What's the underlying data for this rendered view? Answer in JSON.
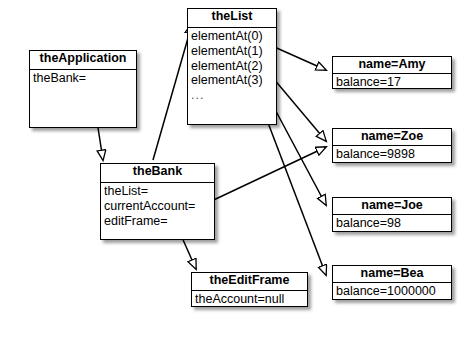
{
  "diagram": {
    "type": "uml-object-diagram",
    "background_color": "#ffffff",
    "line_color": "#000000",
    "box_fill": "#ffffff",
    "box_border": "#000000"
  },
  "boxes": [
    {
      "id": "theApplication",
      "title": "theApplication",
      "attrs": [
        "theBank="
      ],
      "x": 29,
      "y": 50,
      "w": 108,
      "h": 78,
      "header_h": 19
    },
    {
      "id": "theList",
      "title": "theList",
      "attrs": [
        "elementAt(0)",
        "elementAt(1)",
        "elementAt(2)",
        "elementAt(3)",
        "..."
      ],
      "x": 187,
      "y": 8,
      "w": 90,
      "h": 117,
      "header_h": 19
    },
    {
      "id": "theBank",
      "title": "theBank",
      "attrs": [
        "theList=",
        "currentAccount=",
        "editFrame="
      ],
      "x": 100,
      "y": 163,
      "w": 115,
      "h": 77,
      "header_h": 19
    },
    {
      "id": "theEditFrame",
      "title": "theEditFrame",
      "attrs": [
        "theAccount=null"
      ],
      "x": 191,
      "y": 272,
      "w": 117,
      "h": 35,
      "header_h": 18
    },
    {
      "id": "accountAmy",
      "title": "name=Amy",
      "attrs": [
        "balance=17"
      ],
      "x": 332,
      "y": 56,
      "w": 120,
      "h": 33,
      "header_h": 17
    },
    {
      "id": "accountZoe",
      "title": "name=Zoe",
      "attrs": [
        "balance=9898"
      ],
      "x": 332,
      "y": 128,
      "w": 120,
      "h": 35,
      "header_h": 17
    },
    {
      "id": "accountJoe",
      "title": "name=Joe",
      "attrs": [
        "balance=98"
      ],
      "x": 332,
      "y": 197,
      "w": 120,
      "h": 35,
      "header_h": 17
    },
    {
      "id": "accountBea",
      "title": "name=Bea",
      "attrs": [
        "balance=1000000"
      ],
      "x": 332,
      "y": 265,
      "w": 120,
      "h": 35,
      "header_h": 17
    }
  ],
  "edges": [
    {
      "id": "app-to-bank",
      "from": "theApplication.theBank=",
      "to": "theBank",
      "path": "M 90 76 L 103 160"
    },
    {
      "id": "bank-to-list",
      "from": "theBank",
      "to": "theList",
      "path": "M 153 160 L 192 24"
    },
    {
      "id": "list0-to-amy",
      "from": "theList.elementAt(0)",
      "to": "accountAmy",
      "path": "M 252 37 L 326 70"
    },
    {
      "id": "list1-to-zoe",
      "from": "theList.elementAt(1)",
      "to": "accountZoe",
      "path": "M 252 53 L 326 141"
    },
    {
      "id": "list2-to-joe",
      "from": "theList.elementAt(2)",
      "to": "accountJoe",
      "path": "M 254 70 L 326 205"
    },
    {
      "id": "list3-to-bea",
      "from": "theList.elementAt(3)",
      "to": "accountBea",
      "path": "M 254 86 L 326 275"
    },
    {
      "id": "bank-curr-to-zoe",
      "from": "theBank.currentAccount=",
      "to": "accountZoe",
      "path": "M 203 205 L 326 147"
    },
    {
      "id": "bank-edit-to-frame",
      "from": "theBank.editFrame=",
      "to": "theEditFrame",
      "path": "M 176 224 L 196 269"
    }
  ]
}
